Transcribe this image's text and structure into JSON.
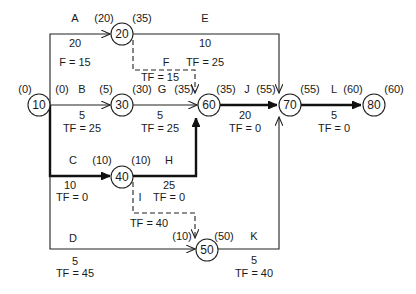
{
  "diagram": {
    "type": "activity-on-arrow network (CPM)",
    "nodes": [
      {
        "id": "10",
        "label": "10",
        "early": "(0)"
      },
      {
        "id": "20",
        "label": "20",
        "early_in": "(20)",
        "late_out": "(35)"
      },
      {
        "id": "30",
        "label": "30",
        "early_in": "(5)",
        "late_out": "(30)"
      },
      {
        "id": "40",
        "label": "40",
        "early_in": "(10)",
        "late_out": "(10)"
      },
      {
        "id": "50",
        "label": "50",
        "early_in": "(10)",
        "late_out": "(50)"
      },
      {
        "id": "60",
        "label": "60",
        "early_in": "(35)",
        "late_out": "(35)"
      },
      {
        "id": "70",
        "label": "70",
        "early_in": "(55)",
        "late_out": "(55)"
      },
      {
        "id": "80",
        "label": "80",
        "early_in": "(60)",
        "late_out": "(60)"
      }
    ],
    "activities": {
      "A": {
        "name": "A",
        "duration": "20",
        "float": "F = 15",
        "start_time": "(0)"
      },
      "B": {
        "name": "B",
        "duration": "5",
        "float": "TF = 25",
        "start_time": "(0)"
      },
      "C": {
        "name": "C",
        "duration": "10",
        "float": "TF = 0"
      },
      "D": {
        "name": "D",
        "duration": "5",
        "float": "TF = 45"
      },
      "E": {
        "name": "E",
        "duration": "10",
        "float": "TF = 25"
      },
      "F": {
        "name": "F",
        "float": "TF = 15"
      },
      "G": {
        "name": "G",
        "duration": "5",
        "float": "TF = 25"
      },
      "H": {
        "name": "H",
        "duration": "25",
        "float": "TF = 0"
      },
      "I": {
        "name": "I",
        "float": "TF = 40"
      },
      "J": {
        "name": "J",
        "duration": "20",
        "float": "TF = 0"
      },
      "K": {
        "name": "K",
        "duration": "5",
        "float": "TF = 40"
      },
      "L": {
        "name": "L",
        "duration": "5",
        "float": "TF = 0"
      }
    },
    "time_labels": {
      "n10_start": "(0)",
      "b_start": "(0)",
      "n20_in": "(20)",
      "n20_out": "(35)",
      "n30_in": "(5)",
      "n30_out": "(30)",
      "g_end": "(35)",
      "n60_out": "(35)",
      "j_end": "(55)",
      "n70_out": "(55)",
      "l_end": "(60)",
      "n80_out": "(60)",
      "n40_in": "(10)",
      "n40_out": "(10)",
      "n50_in": "(10)",
      "n50_out": "(50)"
    },
    "critical_path": [
      "10",
      "40",
      "60",
      "70",
      "80"
    ]
  }
}
